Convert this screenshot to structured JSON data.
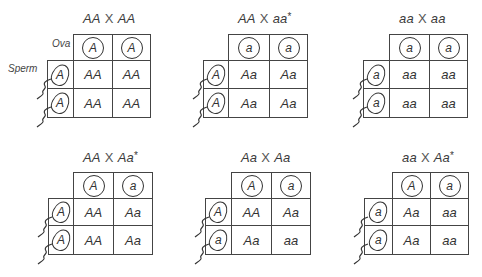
{
  "labels": {
    "ova": "Ova",
    "sperm": "Sperm",
    "cross_symbol": "X"
  },
  "panels": [
    {
      "title_left": "AA",
      "title_right": "AA",
      "title_star": "",
      "ova": [
        "A",
        "A"
      ],
      "sperm": [
        "A",
        "A"
      ],
      "cells": [
        [
          "AA",
          "AA"
        ],
        [
          "AA",
          "AA"
        ]
      ]
    },
    {
      "title_left": "AA",
      "title_right": "aa",
      "title_star": "*",
      "ova": [
        "a",
        "a"
      ],
      "sperm": [
        "A",
        "A"
      ],
      "cells": [
        [
          "Aa",
          "Aa"
        ],
        [
          "Aa",
          "Aa"
        ]
      ]
    },
    {
      "title_left": "aa",
      "title_right": "aa",
      "title_star": "",
      "ova": [
        "a",
        "a"
      ],
      "sperm": [
        "a",
        "a"
      ],
      "cells": [
        [
          "aa",
          "aa"
        ],
        [
          "aa",
          "aa"
        ]
      ]
    },
    {
      "title_left": "AA",
      "title_right": "Aa",
      "title_star": "*",
      "ova": [
        "A",
        "a"
      ],
      "sperm": [
        "A",
        "A"
      ],
      "cells": [
        [
          "AA",
          "Aa"
        ],
        [
          "AA",
          "Aa"
        ]
      ]
    },
    {
      "title_left": "Aa",
      "title_right": "Aa",
      "title_star": "",
      "ova": [
        "A",
        "a"
      ],
      "sperm": [
        "A",
        "a"
      ],
      "cells": [
        [
          "AA",
          "Aa"
        ],
        [
          "Aa",
          "aa"
        ]
      ]
    },
    {
      "title_left": "aa",
      "title_right": "Aa",
      "title_star": "*",
      "ova": [
        "A",
        "a"
      ],
      "sperm": [
        "a",
        "a"
      ],
      "cells": [
        [
          "Aa",
          "aa"
        ],
        [
          "Aa",
          "aa"
        ]
      ]
    }
  ]
}
